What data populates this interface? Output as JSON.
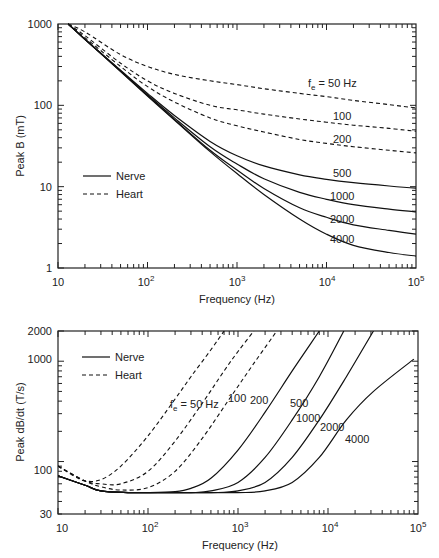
{
  "header_fragment": "",
  "chart_data": [
    {
      "type": "line",
      "title": "",
      "xlabel": "Frequency (Hz)",
      "ylabel": "Peak B (mT)",
      "xscale": "log",
      "yscale": "log",
      "xlim": [
        10,
        100000
      ],
      "ylim": [
        1,
        1000
      ],
      "x_tick_labels": [
        "10",
        "10^2",
        "10^3",
        "10^4",
        "10^5"
      ],
      "y_tick_labels": [
        "1",
        "10",
        "100",
        "1000"
      ],
      "grid": false,
      "legend": {
        "position": "left-middle",
        "entries": [
          {
            "label": "Nerve",
            "style": "solid"
          },
          {
            "label": "Heart",
            "style": "dashed"
          }
        ]
      },
      "annotations": [
        "f_e = 50 Hz",
        "100",
        "200",
        "500",
        "1000",
        "2000",
        "4000"
      ],
      "x": [
        13,
        20,
        50,
        100,
        200,
        500,
        1000,
        2000,
        5000,
        10000,
        20000,
        50000,
        100000
      ],
      "series": [
        {
          "name": "Heart f_e=50 Hz",
          "style": "dashed",
          "values": [
            1000,
            800,
            420,
            300,
            240,
            200,
            180,
            160,
            140,
            128,
            115,
            102,
            93
          ]
        },
        {
          "name": "Heart f_e=100 Hz",
          "style": "dashed",
          "values": [
            1000,
            720,
            330,
            200,
            140,
            100,
            88,
            78,
            68,
            62,
            57,
            52,
            48
          ]
        },
        {
          "name": "Heart f_e=200 Hz",
          "style": "dashed",
          "values": [
            1000,
            680,
            300,
            170,
            110,
            70,
            56,
            47,
            38,
            34,
            31,
            28,
            26
          ]
        },
        {
          "name": "Nerve f_e=500 Hz",
          "style": "solid",
          "values": [
            1000,
            650,
            270,
            140,
            75,
            36,
            24,
            18,
            14,
            12.3,
            11.2,
            10.2,
            9.6
          ]
        },
        {
          "name": "Nerve f_e=1000 Hz",
          "style": "solid",
          "values": [
            1000,
            650,
            265,
            135,
            70,
            31,
            19,
            12.5,
            8.5,
            7,
            6,
            5.3,
            4.9
          ]
        },
        {
          "name": "Nerve f_e=2000 Hz",
          "style": "solid",
          "values": [
            1000,
            650,
            262,
            132,
            67,
            28,
            16,
            9.5,
            5.5,
            4.2,
            3.4,
            2.9,
            2.6
          ]
        },
        {
          "name": "Nerve f_e=4000 Hz",
          "style": "solid",
          "values": [
            1000,
            650,
            260,
            130,
            66,
            27,
            14.5,
            8,
            4,
            2.6,
            1.9,
            1.55,
            1.4
          ]
        }
      ]
    },
    {
      "type": "line",
      "title": "",
      "xlabel": "Frequency (Hz)",
      "ylabel": "Peak dB/dt (T/s)",
      "xscale": "log",
      "yscale": "log",
      "xlim": [
        10,
        100000
      ],
      "ylim": [
        30,
        2000
      ],
      "x_tick_labels": [
        "10",
        "10^2",
        "10^3",
        "10^4",
        "10^5"
      ],
      "y_tick_labels": [
        "30",
        "100",
        "1000",
        "2000"
      ],
      "grid": false,
      "legend": {
        "position": "upper-left",
        "entries": [
          {
            "label": "Nerve",
            "style": "solid"
          },
          {
            "label": "Heart",
            "style": "dashed"
          }
        ]
      },
      "annotations": [
        "f_e = 50 Hz",
        "100",
        "200",
        "500",
        "1000",
        "2000",
        "4000"
      ],
      "series": [
        {
          "name": "Heart f_e=50 Hz",
          "style": "dashed",
          "x": [
            10,
            15,
            20,
            30,
            50,
            100,
            200,
            300,
            500,
            700
          ],
          "values": [
            90,
            72,
            64,
            66,
            90,
            180,
            420,
            700,
            1300,
            2000
          ]
        },
        {
          "name": "Heart f_e=100 Hz",
          "style": "dashed",
          "x": [
            10,
            20,
            30,
            50,
            100,
            200,
            400,
            700,
            1000,
            1500
          ],
          "values": [
            90,
            64,
            60,
            60,
            80,
            160,
            380,
            800,
            1250,
            2000
          ]
        },
        {
          "name": "Heart f_e=200 Hz",
          "style": "dashed",
          "x": [
            10,
            20,
            30,
            50,
            100,
            200,
            400,
            800,
            1500,
            2700
          ],
          "values": [
            90,
            64,
            56,
            52,
            55,
            80,
            170,
            420,
            950,
            2000
          ]
        },
        {
          "name": "Nerve f_e=500 Hz",
          "style": "solid",
          "x": [
            10,
            20,
            30,
            60,
            100,
            200,
            300,
            500,
            1000,
            2000,
            4000,
            8000
          ],
          "values": [
            72,
            58,
            51,
            49,
            49,
            50,
            54,
            68,
            130,
            310,
            800,
            2000
          ]
        },
        {
          "name": "Nerve f_e=1000 Hz",
          "style": "solid",
          "x": [
            10,
            20,
            30,
            60,
            100,
            300,
            500,
            1000,
            2000,
            4000,
            8000,
            15000
          ],
          "values": [
            72,
            58,
            51,
            49,
            49,
            49,
            51,
            62,
            110,
            260,
            700,
            2000
          ]
        },
        {
          "name": "Nerve f_e=2000 Hz",
          "style": "solid",
          "x": [
            10,
            20,
            30,
            60,
            100,
            500,
            1000,
            2000,
            4000,
            8000,
            16000,
            32000
          ],
          "values": [
            72,
            58,
            51,
            49,
            49,
            49,
            51,
            62,
            110,
            260,
            700,
            2000
          ]
        },
        {
          "name": "Nerve f_e=4000 Hz",
          "style": "solid",
          "x": [
            10,
            20,
            30,
            60,
            100,
            1000,
            2000,
            4000,
            8000,
            16000,
            32000,
            90000
          ],
          "values": [
            72,
            58,
            51,
            49,
            49,
            49,
            51,
            62,
            110,
            260,
            500,
            1050
          ]
        }
      ]
    }
  ],
  "labels": {
    "top_ylabel": "Peak B (mT)",
    "top_xlabel": "Frequency (Hz)",
    "bottom_ylabel": "Peak dB/dt (T/s)",
    "bottom_xlabel": "Frequency (Hz)",
    "legend_nerve": "Nerve",
    "legend_heart": "Heart",
    "top_ann_50": "50 Hz",
    "top_ann_fe": "f",
    "top_ann_sub": "e",
    "top_ann_eq": "=",
    "top_ann_100": "100",
    "top_ann_200": "200",
    "top_ann_500": "500",
    "top_ann_1000": "1000",
    "top_ann_2000": "2000",
    "top_ann_4000": "4000",
    "bot_ann_50": "50 Hz",
    "bot_ann_100": "100",
    "bot_ann_200": "200",
    "bot_ann_500": "500",
    "bot_ann_1000": "1000",
    "bot_ann_2000": "2000",
    "bot_ann_4000": "4000",
    "top_y": [
      "1000",
      "100",
      "10",
      "1"
    ],
    "bot_y": [
      "2000",
      "1000",
      "100",
      "30"
    ],
    "x_base": "10",
    "x_exp": [
      "2",
      "3",
      "4",
      "5"
    ]
  }
}
